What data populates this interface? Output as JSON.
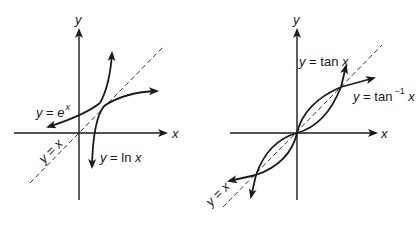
{
  "panels": [
    {
      "name": "exponential-log",
      "axis_x_label": "x",
      "axis_y_label": "y",
      "curves": [
        {
          "name": "exp",
          "label_pre": "y = e",
          "label_sup": "x"
        },
        {
          "name": "ln",
          "label": "y = ln x"
        }
      ],
      "identity_label": "y = x"
    },
    {
      "name": "tan-arctan",
      "axis_x_label": "x",
      "axis_y_label": "y",
      "curves": [
        {
          "name": "tan",
          "label": "y = tan x"
        },
        {
          "name": "arctan",
          "label_pre": "y = tan",
          "label_sup": "−1",
          "label_post": " x"
        }
      ],
      "identity_label": "y = x"
    }
  ],
  "colors": {
    "ink": "#1a1a1a",
    "background": "#ffffff"
  }
}
